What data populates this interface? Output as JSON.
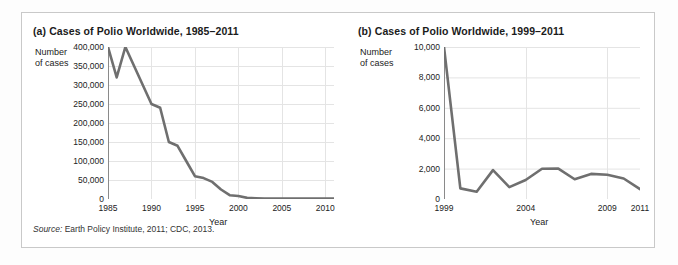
{
  "figure": {
    "source_prefix": "Source:",
    "source_text": "Earth Policy Institute, 2011; CDC, 2013.",
    "line_color": "#6f6f6f",
    "grid_color": "#e4e4e4",
    "axis_color": "#8a8a8a",
    "panel_border_color": "#c9c9c9"
  },
  "chart_data": [
    {
      "id": "chart-a",
      "type": "line",
      "title": "(a) Cases of Polio Worldwide, 1985–2011",
      "ylabel": "Number\nof cases",
      "ylabel_line1": "Number",
      "ylabel_line2": "of cases",
      "xlabel": "Year",
      "xlim": [
        1985,
        2011
      ],
      "ylim": [
        0,
        400000
      ],
      "yticks": [
        0,
        50000,
        100000,
        150000,
        200000,
        250000,
        300000,
        350000,
        400000
      ],
      "ytick_labels": [
        "0",
        "50,000",
        "100,000",
        "150,000",
        "200,000",
        "250,000",
        "300,000",
        "350,000",
        "400,000"
      ],
      "xticks": [
        1985,
        1990,
        1995,
        2000,
        2005,
        2010
      ],
      "xtick_labels": [
        "1985",
        "1990",
        "1995",
        "2000",
        "2005",
        "2010"
      ],
      "grid": true,
      "legend": "none",
      "x": [
        1985,
        1986,
        1987,
        1988,
        1989,
        1990,
        1991,
        1992,
        1993,
        1994,
        1995,
        1996,
        1997,
        1998,
        1999,
        2000,
        2001,
        2002,
        2003,
        2004,
        2005,
        2006,
        2007,
        2008,
        2009,
        2010,
        2011
      ],
      "values": [
        400000,
        320000,
        400000,
        350000,
        300000,
        250000,
        240000,
        150000,
        140000,
        100000,
        60000,
        55000,
        45000,
        25000,
        10000,
        8000,
        3000,
        2000,
        1500,
        1500,
        1500,
        1500,
        1500,
        1500,
        1500,
        1500,
        1500
      ]
    },
    {
      "id": "chart-b",
      "type": "line",
      "title": "(b) Cases of Polio Worldwide, 1999–2011",
      "ylabel": "Number\nof cases",
      "ylabel_line1": "Number",
      "ylabel_line2": "of cases",
      "xlabel": "Year",
      "xlim": [
        1999,
        2011
      ],
      "ylim": [
        0,
        10000
      ],
      "yticks": [
        0,
        2000,
        4000,
        6000,
        8000,
        10000
      ],
      "ytick_labels": [
        "0",
        "2,000",
        "4,000",
        "6,000",
        "8,000",
        "10,000"
      ],
      "xticks": [
        1999,
        2004,
        2009,
        2011
      ],
      "xtick_labels": [
        "1999",
        "2004",
        "2009",
        "2011"
      ],
      "grid": true,
      "legend": "none",
      "x": [
        1999,
        2000,
        2001,
        2002,
        2003,
        2004,
        2005,
        2006,
        2007,
        2008,
        2009,
        2010,
        2011
      ],
      "values": [
        10000,
        700,
        480,
        1900,
        780,
        1250,
        1990,
        2000,
        1300,
        1650,
        1600,
        1350,
        650
      ]
    }
  ]
}
